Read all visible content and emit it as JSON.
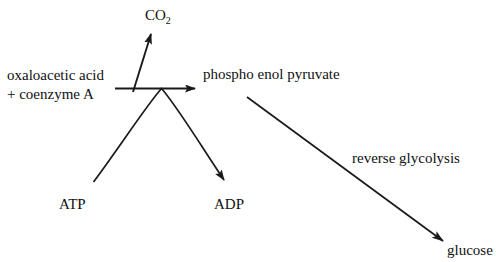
{
  "figure": {
    "type": "biochemical-pathway-diagram",
    "background_color": "#ffffff",
    "stroke_color": "#1a1a1a",
    "width": 496,
    "height": 262
  },
  "labels": {
    "substrate_line1": "oxaloacetic acid",
    "substrate_line2": "+ coenzyme A",
    "product": "phospho enol pyruvate",
    "co2_text": "CO",
    "co2_subscript": "2",
    "atp": "ATP",
    "adp": "ADP",
    "pathway": "reverse glycolysis",
    "glucose": "glucose",
    "clipped_header": ""
  },
  "arrows": [
    {
      "name": "main-reaction-arrow",
      "from": "oxaloacetic acid + coenzyme A",
      "to": "phospho enol pyruvate",
      "style": "straight-horizontal"
    },
    {
      "name": "co2-release-arrow",
      "from": "reaction center",
      "to": "CO2",
      "style": "straight-diagonal-up"
    },
    {
      "name": "atp-to-adp-arc",
      "from": "ATP",
      "to": "ADP",
      "style": "curved-arc-over-reaction"
    },
    {
      "name": "reverse-glycolysis-arrow",
      "from": "phospho enol pyruvate",
      "to": "glucose",
      "style": "straight-diagonal-down",
      "annotation": "reverse glycolysis"
    }
  ]
}
